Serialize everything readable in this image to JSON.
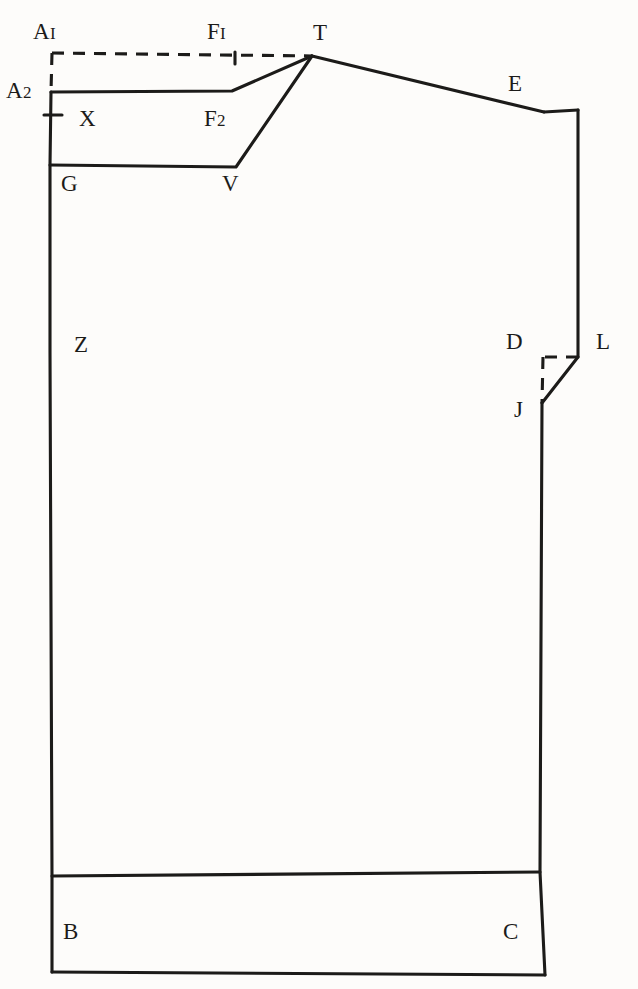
{
  "figure": {
    "kind": "pattern-draft",
    "background_color": "#fdfcfa",
    "ink_color": "#1c1b19",
    "width": 638,
    "height": 989
  },
  "labels": [
    {
      "id": "A1",
      "base": "A",
      "sub": "I",
      "text": "AI",
      "x": 33,
      "y": 20
    },
    {
      "id": "F1",
      "base": "F",
      "sub": "I",
      "text": "FI",
      "x": 207,
      "y": 20
    },
    {
      "id": "T",
      "base": "T",
      "sub": "",
      "text": "T",
      "x": 313,
      "y": 21
    },
    {
      "id": "A2",
      "base": "A",
      "sub": "2",
      "text": "A2",
      "x": 6,
      "y": 79
    },
    {
      "id": "E",
      "base": "E",
      "sub": "",
      "text": "E",
      "x": 508,
      "y": 72
    },
    {
      "id": "X",
      "base": "X",
      "sub": "",
      "text": "X",
      "x": 79,
      "y": 107
    },
    {
      "id": "F2",
      "base": "F",
      "sub": "2",
      "text": "F2",
      "x": 204,
      "y": 107
    },
    {
      "id": "G",
      "base": "G",
      "sub": "",
      "text": "G",
      "x": 61,
      "y": 172
    },
    {
      "id": "V",
      "base": "V",
      "sub": "",
      "text": "V",
      "x": 222,
      "y": 172
    },
    {
      "id": "Z",
      "base": "Z",
      "sub": "",
      "text": "Z",
      "x": 74,
      "y": 333
    },
    {
      "id": "D",
      "base": "D",
      "sub": "",
      "text": "D",
      "x": 506,
      "y": 330
    },
    {
      "id": "L",
      "base": "L",
      "sub": "",
      "text": "L",
      "x": 596,
      "y": 330
    },
    {
      "id": "J",
      "base": "J",
      "sub": "",
      "text": "J",
      "x": 514,
      "y": 398
    },
    {
      "id": "B",
      "base": "B",
      "sub": "",
      "text": "B",
      "x": 63,
      "y": 920
    },
    {
      "id": "C",
      "base": "C",
      "sub": "",
      "text": "C",
      "x": 503,
      "y": 920
    }
  ],
  "points": {
    "A1": {
      "x": 52,
      "y": 53
    },
    "F1": {
      "x": 235,
      "y": 55
    },
    "T": {
      "x": 312,
      "y": 56
    },
    "A2": {
      "x": 51,
      "y": 92
    },
    "F2": {
      "x": 235,
      "y": 92
    },
    "E": {
      "x": 544,
      "y": 112
    },
    "E2": {
      "x": 578,
      "y": 110
    },
    "X": {
      "x": 51,
      "y": 115
    },
    "G": {
      "x": 50,
      "y": 165
    },
    "V": {
      "x": 237,
      "y": 167
    },
    "Z": {
      "x": 50,
      "y": 352
    },
    "D": {
      "x": 543,
      "y": 357
    },
    "L": {
      "x": 578,
      "y": 357
    },
    "J": {
      "x": 542,
      "y": 403
    },
    "B": {
      "x": 52,
      "y": 972
    },
    "C": {
      "x": 545,
      "y": 975
    },
    "Bh": {
      "x": 52,
      "y": 876
    },
    "Ch": {
      "x": 540,
      "y": 872
    }
  },
  "solid_paths": [
    {
      "name": "left-center-front-edge",
      "d": "M 51 92 L 50 165 L 50 352 L 52 876 L 52 972"
    },
    {
      "name": "neckline-a2-to-f2",
      "d": "M 51 92 L 232 91 L 312 56"
    },
    {
      "name": "armhole-guide-g-to-v",
      "d": "M 50 165 L 236 167 L 312 56"
    },
    {
      "name": "shoulder-t-to-e",
      "d": "M 312 56 L 544 112"
    },
    {
      "name": "shoulder-tip-e-square",
      "d": "M 544 112 L 578 110"
    },
    {
      "name": "side-seam-upper-e-to-l",
      "d": "M 578 110 L 578 357"
    },
    {
      "name": "side-seam-l-to-j",
      "d": "M 578 357 L 542 403"
    },
    {
      "name": "side-seam-j-to-hem",
      "d": "M 542 403 L 540 872 L 545 975"
    },
    {
      "name": "hem-band-top",
      "d": "M 52 876 L 540 872"
    },
    {
      "name": "hem-band-bottom",
      "d": "M 52 972 L 545 975"
    }
  ],
  "dashed_paths": [
    {
      "name": "construction-a1-to-t",
      "d": "M 52 53 L 312 56"
    },
    {
      "name": "construction-a1-to-a2",
      "d": "M 52 53 L 51 92"
    },
    {
      "name": "construction-l-to-d",
      "d": "M 578 357 L 543 357"
    },
    {
      "name": "construction-d-to-j",
      "d": "M 543 357 L 542 403"
    }
  ],
  "tick_marks": [
    {
      "name": "tick-f1",
      "d": "M 235 52 L 235 64"
    },
    {
      "name": "tick-x",
      "d": "M 44 115 L 62 115"
    }
  ]
}
